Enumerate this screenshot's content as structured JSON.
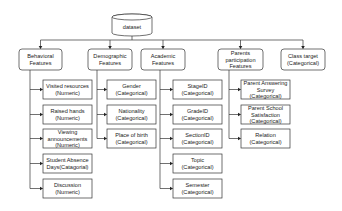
{
  "diagram": {
    "type": "feature-hierarchy",
    "root": {
      "label": "dataset",
      "shape": "cylinder",
      "x": 112,
      "y": 14,
      "w": 40,
      "h": 22
    },
    "bus_y": 40,
    "colors": {
      "stroke": "#333333",
      "text": "#222222",
      "fill": "#ffffff"
    },
    "categories": [
      {
        "id": "behavioral",
        "lines": [
          "Behavioral",
          "Features"
        ],
        "x": 19,
        "y": 49,
        "w": 43,
        "h": 21,
        "trunk_x": 30,
        "children": [
          {
            "lines": [
              "Visited resources",
              "(Numeric)"
            ],
            "x": 43,
            "y": 80,
            "w": 49,
            "h": 19
          },
          {
            "lines": [
              "Raised hands",
              "(Numeric)"
            ],
            "x": 43,
            "y": 105,
            "w": 49,
            "h": 19
          },
          {
            "lines": [
              "Viewing",
              "announcements",
              "(Numeric)"
            ],
            "x": 43,
            "y": 129,
            "w": 49,
            "h": 19
          },
          {
            "lines": [
              "Student Absence",
              "Days(Catagorial)"
            ],
            "x": 43,
            "y": 154,
            "w": 49,
            "h": 19
          },
          {
            "lines": [
              "Discussion",
              "(Numeric)"
            ],
            "x": 43,
            "y": 179,
            "w": 49,
            "h": 19
          }
        ]
      },
      {
        "id": "demographic",
        "lines": [
          "Demographic",
          "Features"
        ],
        "x": 88,
        "y": 49,
        "w": 44,
        "h": 21,
        "trunk_x": 97,
        "children": [
          {
            "lines": [
              "Gender",
              "(Categorical)"
            ],
            "x": 107,
            "y": 80,
            "w": 49,
            "h": 19
          },
          {
            "lines": [
              "Nationality",
              "(Categorical)"
            ],
            "x": 107,
            "y": 105,
            "w": 49,
            "h": 19
          },
          {
            "lines": [
              "Place of birth",
              "(Categorical)"
            ],
            "x": 107,
            "y": 129,
            "w": 49,
            "h": 19
          }
        ]
      },
      {
        "id": "academic",
        "lines": [
          "Academic",
          "Features"
        ],
        "x": 141,
        "y": 49,
        "w": 44,
        "h": 21,
        "trunk_x": 160,
        "children": [
          {
            "lines": [
              "StageID",
              "(Categorical)"
            ],
            "x": 173,
            "y": 80,
            "w": 49,
            "h": 19
          },
          {
            "lines": [
              "GradeID",
              "(Categorical)"
            ],
            "x": 173,
            "y": 105,
            "w": 49,
            "h": 19
          },
          {
            "lines": [
              "SectionID",
              "(Categorical)"
            ],
            "x": 173,
            "y": 129,
            "w": 49,
            "h": 19
          },
          {
            "lines": [
              "Topic",
              "(Categorical)"
            ],
            "x": 173,
            "y": 154,
            "w": 49,
            "h": 19
          },
          {
            "lines": [
              "Semester",
              "(Categorical)"
            ],
            "x": 173,
            "y": 179,
            "w": 49,
            "h": 19
          }
        ]
      },
      {
        "id": "parents",
        "lines": [
          "Parents",
          "participation",
          "Features"
        ],
        "x": 218,
        "y": 49,
        "w": 45,
        "h": 21,
        "trunk_x": 229,
        "children": [
          {
            "lines": [
              "Parent Answering",
              "Survey",
              "(Categorical)"
            ],
            "x": 241,
            "y": 80,
            "w": 49,
            "h": 19
          },
          {
            "lines": [
              "Parent School",
              "Satisfaction",
              "(Categorical)"
            ],
            "x": 241,
            "y": 105,
            "w": 49,
            "h": 19
          },
          {
            "lines": [
              "Relation",
              "(Categorical)"
            ],
            "x": 241,
            "y": 129,
            "w": 49,
            "h": 19
          }
        ]
      },
      {
        "id": "class-target",
        "lines": [
          "Class target",
          "(Categorical)"
        ],
        "x": 281,
        "y": 49,
        "w": 44,
        "h": 21,
        "trunk_x": null,
        "children": []
      }
    ]
  }
}
